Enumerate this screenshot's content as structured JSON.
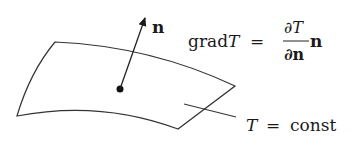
{
  "diagram": {
    "normal_label": "n",
    "formula": {
      "lhs_op": "grad",
      "lhs_var": "T",
      "equals": "=",
      "numerator": "∂T",
      "denominator": "∂n",
      "rhs_vector": "n"
    },
    "surface_label": {
      "var": "T",
      "equals": "=",
      "value": "const"
    }
  },
  "colors": {
    "stroke": "#333333",
    "text": "#1a1a1a",
    "background": "#ffffff"
  }
}
